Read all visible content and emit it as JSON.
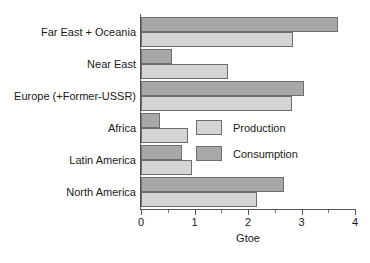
{
  "chart_data": {
    "type": "bar",
    "orientation": "horizontal",
    "title": "",
    "xlabel": "Gtoe",
    "ylabel": "",
    "xlim": [
      0,
      4
    ],
    "xticks": [
      0,
      1,
      2,
      3,
      4
    ],
    "xtick_labels": [
      "0",
      "1",
      "2",
      "3",
      "4"
    ],
    "xminor_ticks": [
      0.5,
      1.5,
      2.5,
      3.5
    ],
    "grid": false,
    "legend_position": "center-right-inside",
    "categories": [
      "Far East + Oceania",
      "Near East",
      "Europe (+Former-USSR)",
      "Africa",
      "Latin America",
      "North America"
    ],
    "series": [
      {
        "name": "Production",
        "color": "#d4d4d4",
        "values": [
          2.85,
          1.62,
          2.82,
          0.88,
          0.96,
          2.16
        ]
      },
      {
        "name": "Consumption",
        "color": "#a8a8a8",
        "values": [
          3.68,
          0.58,
          3.05,
          0.35,
          0.77,
          2.68
        ]
      }
    ]
  },
  "legend": {
    "items": [
      {
        "label": "Production",
        "swatch": "production"
      },
      {
        "label": "Consumption",
        "swatch": "consumption"
      }
    ]
  },
  "colors": {
    "production": "#d4d4d4",
    "consumption": "#a8a8a8",
    "axis": "#555555",
    "text": "#1a1a1a",
    "background": "#ffffff"
  }
}
